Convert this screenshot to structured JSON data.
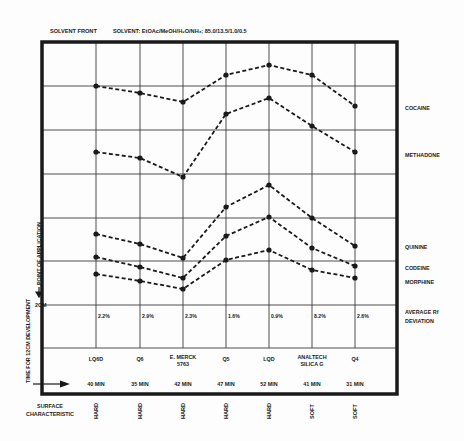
{
  "header": {
    "solvent_front": "SOLVENT FRONT",
    "solvent": "SOLVENT: EtOAc/MeOH/H₂O/NH₃; 85.0/13.5/1.0/0.5"
  },
  "axis_labels": {
    "point_of_application": "POINT OF APPLICATION",
    "time_for_development": "TIME FOR 12CM DEVELOPMENT",
    "two_cm": "2CM",
    "surface_characteristic_1": "SURFACE",
    "surface_characteristic_2": "CHARACTERISTIC",
    "avg_rf_1": "AVERAGE Rf",
    "avg_rf_2": "DEVIATION"
  },
  "chart_data": {
    "type": "line",
    "xlabel": "TLC plate",
    "ylabel": "Migration distance (12cm development, 2cm point of application)",
    "categories": [
      "LQ6D",
      "Q6",
      "E. MERCK 5763",
      "Q5",
      "LQD",
      "ANALTECH SILICA G",
      "Q4"
    ],
    "ylim": [
      2,
      12
    ],
    "grid": true,
    "series": [
      {
        "name": "COCAINE",
        "values": [
          9.0,
          8.85,
          8.6,
          9.6,
          9.9,
          9.6,
          8.5
        ]
      },
      {
        "name": "METHADONE",
        "values": [
          7.5,
          7.35,
          6.9,
          8.3,
          8.75,
          8.0,
          7.5
        ]
      },
      {
        "name": "QUININE",
        "values": [
          3.6,
          3.35,
          3.05,
          4.25,
          4.75,
          4.0,
          3.35
        ]
      },
      {
        "name": "CODEINE",
        "values": [
          3.1,
          2.9,
          2.65,
          3.7,
          4.0,
          3.3,
          2.9
        ]
      },
      {
        "name": "MORPHINE",
        "values": [
          2.7,
          2.55,
          2.35,
          3.05,
          3.3,
          2.85,
          2.65
        ]
      }
    ],
    "average_rf_deviation": [
      "2.2%",
      "2.9%",
      "2.3%",
      "1.6%",
      "0.9%",
      "8.2%",
      "2.6%"
    ],
    "development_time": [
      "40 MIN",
      "35 MIN",
      "42 MIN",
      "47 MIN",
      "52 MIN",
      "41 MIN",
      "31 MIN"
    ],
    "surface_characteristic": [
      "HARD",
      "HARD",
      "HARD",
      "HARD",
      "HARD",
      "SOFT",
      "SOFT"
    ]
  },
  "plates": [
    {
      "name": "LQ6D",
      "line2": ""
    },
    {
      "name": "Q6",
      "line2": ""
    },
    {
      "name": "E. MERCK",
      "line2": "5763"
    },
    {
      "name": "Q5",
      "line2": ""
    },
    {
      "name": "LQD",
      "line2": ""
    },
    {
      "name": "ANALTECH",
      "line2": "SILICA G"
    },
    {
      "name": "Q4",
      "line2": ""
    }
  ],
  "series_plot_y": {
    "COCAINE": [
      86,
      93,
      102,
      75,
      65,
      75,
      106
    ],
    "METHADONE": [
      152,
      158,
      177,
      114,
      98,
      126,
      152
    ],
    "QUININE": [
      234,
      244,
      258,
      207,
      185,
      218,
      246
    ],
    "CODEINE": [
      257,
      267,
      278,
      236,
      217,
      248,
      266
    ],
    "MORPHINE": [
      274,
      281,
      289,
      260,
      250,
      270,
      278
    ]
  },
  "series_label_y": {
    "COCAINE": 110,
    "METHADONE": 157,
    "QUININE": 249,
    "CODEINE": 270,
    "MORPHINE": 284
  },
  "colors": {
    "ink": "#1a1a1a",
    "grid": "#3a3a3a",
    "paper": "#fdfdfd"
  }
}
